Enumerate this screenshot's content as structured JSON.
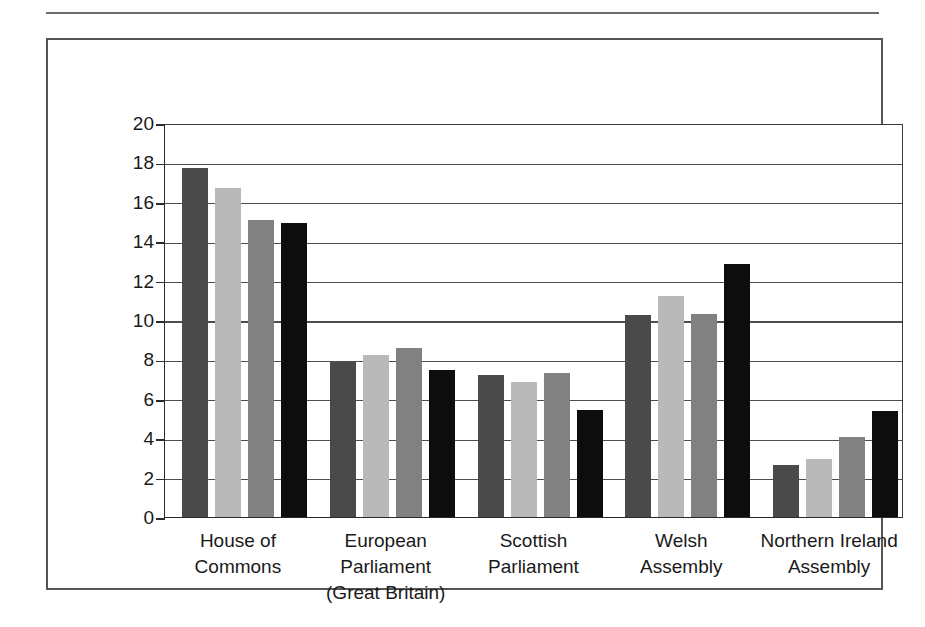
{
  "chart_data": {
    "type": "bar",
    "title": "",
    "subtitle": "",
    "xlabel": "",
    "ylabel": "",
    "ylim": [
      0,
      20
    ],
    "ytick_step": 2,
    "yticks": [
      20,
      18,
      16,
      14,
      12,
      10,
      8,
      6,
      4,
      2,
      0
    ],
    "ytick_labels": [
      "20",
      "18",
      "16",
      "14",
      "12",
      "10",
      "8",
      "6",
      "4",
      "2",
      "0"
    ],
    "grid": true,
    "grid_axis": "y",
    "legend": false,
    "legend_position": "none",
    "annotations": [],
    "categories": [
      "House of Commons",
      "European Parliament (Great Britain)",
      "Scottish Parliament",
      "Welsh Assembly",
      "Northern Ireland Assembly"
    ],
    "category_label_lines": [
      [
        "House of",
        "Commons"
      ],
      [
        "European",
        "Parliament",
        "(Great Britain)"
      ],
      [
        "Scottish",
        "Parliament"
      ],
      [
        "Welsh",
        "Assembly"
      ],
      [
        "Northern Ireland",
        "Assembly"
      ]
    ],
    "series": [
      {
        "name": "Series 1",
        "color": "#4a4a4a",
        "values": [
          17.7,
          7.85,
          7.2,
          10.25,
          2.65
        ]
      },
      {
        "name": "Series 2",
        "color": "#b9b9b9",
        "values": [
          16.7,
          8.2,
          6.85,
          11.2,
          2.95
        ]
      },
      {
        "name": "Series 3",
        "color": "#818181",
        "values": [
          15.1,
          8.6,
          7.3,
          10.3,
          4.05
        ]
      },
      {
        "name": "Series 4",
        "color": "#0d0d0d",
        "values": [
          14.95,
          7.45,
          5.45,
          12.85,
          5.4
        ]
      }
    ]
  },
  "figure": {
    "frame_color": "#555555",
    "top_rule_color": "#6b6b6b",
    "axis_color": "#2b2b2b",
    "gridline_color": "#4d4d4d",
    "background": "#ffffff"
  }
}
